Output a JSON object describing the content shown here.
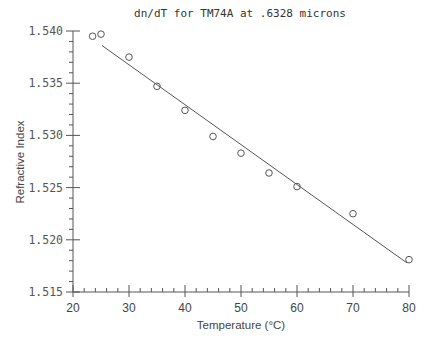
{
  "chart_data": {
    "type": "scatter",
    "title": "dn/dT for TM74A at .6328 microns",
    "xlabel": "Temperature (°C)",
    "ylabel": "Refractive Index",
    "xlim": [
      20,
      80
    ],
    "ylim": [
      1.515,
      1.54
    ],
    "x_ticks": [
      20,
      30,
      40,
      50,
      60,
      70,
      80
    ],
    "x_tick_labels": [
      "20",
      "30",
      "40",
      "50",
      "60",
      "70",
      "80"
    ],
    "y_ticks": [
      1.515,
      1.52,
      1.525,
      1.53,
      1.535,
      1.54
    ],
    "y_tick_labels": [
      "1.515",
      "1.520",
      "1.525",
      "1.530",
      "1.535",
      "1.540"
    ],
    "x_minor_step": 2,
    "y_minor_step": 0.001,
    "grid": false,
    "legend": null,
    "series": [
      {
        "name": "measured",
        "marker": "open-circle",
        "x": [
          23.5,
          25,
          30,
          35,
          40,
          45,
          50,
          55,
          60,
          70,
          80
        ],
        "y": [
          1.5395,
          1.5397,
          1.5375,
          1.5347,
          1.5324,
          1.5299,
          1.5283,
          1.5264,
          1.5251,
          1.5225,
          1.5181
        ]
      },
      {
        "name": "linear fit",
        "type": "line",
        "x": [
          25.2,
          79.6
        ],
        "y": [
          1.5386,
          1.5178
        ]
      }
    ]
  }
}
